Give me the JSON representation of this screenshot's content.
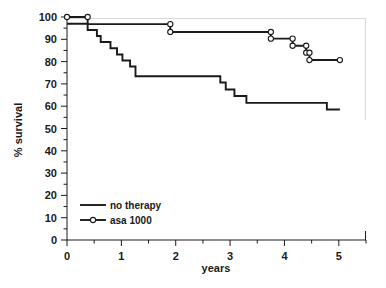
{
  "chart_data": {
    "type": "line",
    "title": "",
    "subtitle": "",
    "xlabel": "years",
    "ylabel": "% survival",
    "xlim": [
      0,
      5.5
    ],
    "ylim": [
      0,
      100
    ],
    "xticks": [
      0,
      1,
      2,
      3,
      4,
      5
    ],
    "xticklabels": [
      "0",
      "1",
      "2",
      "3",
      "4",
      "5"
    ],
    "xminor_step": 0.5,
    "yticks": [
      0,
      10,
      20,
      30,
      40,
      50,
      60,
      70,
      80,
      90,
      100
    ],
    "yticklabels": [
      "0",
      "10",
      "20",
      "30",
      "40",
      "50",
      "60",
      "70",
      "80",
      "90",
      "100"
    ],
    "yminor_step": 5,
    "grid": false,
    "legend_position": "lower-left",
    "line_color": "#1a1a1a",
    "marker_face_color": "#ffffff",
    "series": [
      {
        "name": "no therapy",
        "marker": "none",
        "points": [
          [
            0.0,
            97.0
          ],
          [
            0.38,
            97.0
          ],
          [
            0.38,
            94.2
          ],
          [
            0.55,
            94.2
          ],
          [
            0.55,
            91.5
          ],
          [
            0.62,
            91.5
          ],
          [
            0.62,
            88.8
          ],
          [
            0.8,
            88.8
          ],
          [
            0.8,
            86.0
          ],
          [
            0.92,
            86.0
          ],
          [
            0.92,
            83.2
          ],
          [
            1.02,
            83.2
          ],
          [
            1.02,
            80.5
          ],
          [
            1.16,
            80.5
          ],
          [
            1.16,
            77.8
          ],
          [
            1.26,
            77.8
          ],
          [
            1.26,
            73.4
          ],
          [
            2.82,
            73.4
          ],
          [
            2.82,
            70.6
          ],
          [
            2.92,
            70.6
          ],
          [
            2.92,
            67.5
          ],
          [
            3.08,
            67.5
          ],
          [
            3.08,
            64.6
          ],
          [
            3.3,
            64.6
          ],
          [
            3.3,
            61.5
          ],
          [
            4.78,
            61.5
          ],
          [
            4.78,
            58.5
          ],
          [
            5.02,
            58.5
          ]
        ],
        "censor_points": []
      },
      {
        "name": "asa 1000",
        "marker": "open-circle",
        "points": [
          [
            0.0,
            100.0
          ],
          [
            0.38,
            100.0
          ],
          [
            0.38,
            96.8
          ],
          [
            1.9,
            96.8
          ],
          [
            1.9,
            93.3
          ],
          [
            3.75,
            93.3
          ],
          [
            3.75,
            90.3
          ],
          [
            4.15,
            90.3
          ],
          [
            4.15,
            87.1
          ],
          [
            4.4,
            87.1
          ],
          [
            4.4,
            84.0
          ],
          [
            4.46,
            84.0
          ],
          [
            4.46,
            80.7
          ],
          [
            5.02,
            80.7
          ]
        ],
        "censor_points": [
          [
            0.0,
            100.0
          ],
          [
            0.38,
            100.0
          ],
          [
            1.9,
            96.8
          ],
          [
            1.9,
            93.3
          ],
          [
            3.75,
            93.3
          ],
          [
            3.75,
            90.3
          ],
          [
            4.15,
            90.3
          ],
          [
            4.15,
            87.1
          ],
          [
            4.4,
            87.1
          ],
          [
            4.4,
            84.0
          ],
          [
            4.46,
            84.0
          ],
          [
            4.46,
            80.7
          ],
          [
            5.02,
            80.7
          ]
        ]
      }
    ]
  },
  "legend": {
    "entries": [
      {
        "label": "no therapy",
        "marker": "none"
      },
      {
        "label": "asa 1000",
        "marker": "open-circle"
      }
    ]
  }
}
